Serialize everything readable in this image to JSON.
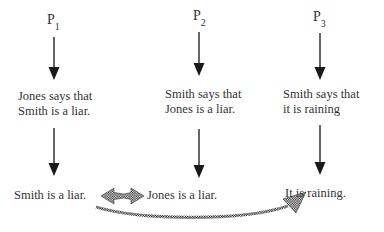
{
  "diagram": {
    "columns": [
      {
        "premise": {
          "letter": "P",
          "index": "1"
        },
        "statement_lines": [
          "Jones says that",
          "Smith is a liar."
        ],
        "conclusion": "Smith is a liar."
      },
      {
        "premise": {
          "letter": "P",
          "index": "2"
        },
        "statement_lines": [
          "Smith says that",
          "Jones is a liar."
        ],
        "conclusion": "Jones is a liar."
      },
      {
        "premise": {
          "letter": "P",
          "index": "3"
        },
        "statement_lines": [
          "Smith says that",
          "it is raining"
        ],
        "conclusion": "It is raining."
      }
    ],
    "connectors": [
      {
        "type": "double-headed-checkered-arrow",
        "from": "Smith is a liar.",
        "to": "Jones is a liar."
      },
      {
        "type": "curved-checkered-arrow",
        "from": "Smith is a liar.",
        "to": "It is raining."
      }
    ],
    "colors": {
      "arrow": "#222222",
      "text": "#333333",
      "checker_dark": "#1a1a1a",
      "checker_light": "#ffffff"
    }
  }
}
